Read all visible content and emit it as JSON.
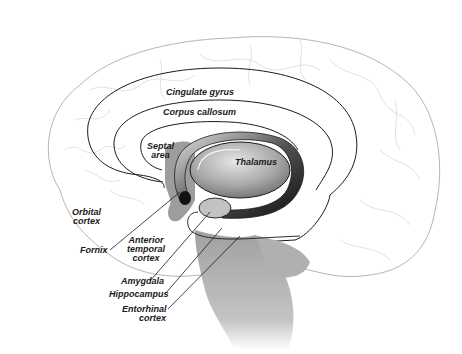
{
  "diagram": {
    "colors": {
      "background": "#ffffff",
      "outline": "#b5b5b5",
      "sulci": "#cfcfcf",
      "structure_line": "#1a1a1a",
      "shadow": "#9a9a9a",
      "thalamus_light": "#e0e0e0",
      "thalamus_dark": "#6a6a6a",
      "fornix_dark": "#111111"
    },
    "labels": {
      "cingulate_gyrus": "Cingulate gyrus",
      "corpus_callosum": "Corpus callosum",
      "septal_area_line1": "Septal",
      "septal_area_line2": "area",
      "thalamus": "Thalamus",
      "orbital_cortex_line1": "Orbital",
      "orbital_cortex_line2": "cortex",
      "fornix": "Fornix",
      "anterior_temporal_cortex_line1": "Anterior",
      "anterior_temporal_cortex_line2": "temporal",
      "anterior_temporal_cortex_line3": "cortex",
      "amygdala": "Amygdala",
      "hippocampus": "Hippocampus",
      "entorhinal_cortex_line1": "Entorhinal",
      "entorhinal_cortex_line2": "cortex"
    }
  }
}
